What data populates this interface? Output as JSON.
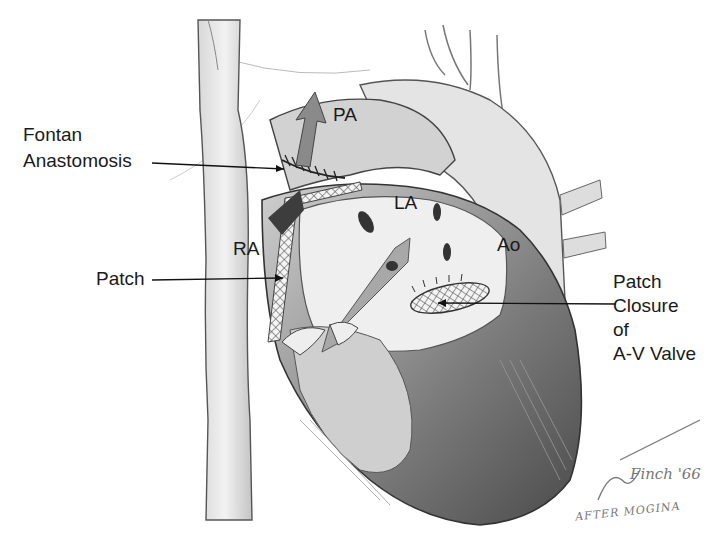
{
  "figure": {
    "labels": {
      "fontan_line1": "Fontan",
      "fontan_line2": "Anastomosis",
      "patch": "Patch",
      "pa": "PA",
      "la": "LA",
      "ra": "RA",
      "ao": "Ao",
      "closure_line1": "Patch",
      "closure_line2": "Closure",
      "closure_line3": "of",
      "closure_line4": "A-V Valve"
    },
    "signature": {
      "name": "Finch '66",
      "subtitle": "AFTER MOGINA"
    },
    "colors": {
      "ink": "#1a1a1a",
      "shade_light": "#e6e6e6",
      "shade_mid": "#bdbdbd",
      "shade_dark": "#6e6e6e"
    }
  }
}
